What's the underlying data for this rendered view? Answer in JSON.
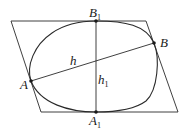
{
  "diagram": {
    "colors": {
      "stroke": "#2a2a2a",
      "background": "#ffffff",
      "text": "#1a1a1a"
    },
    "parallelogram": {
      "vertices": [
        [
          11,
          21
        ],
        [
          146,
          21
        ],
        [
          178,
          112
        ],
        [
          41,
          112
        ]
      ]
    },
    "points": {
      "A": {
        "label": "A",
        "sub": "",
        "x": 31,
        "y": 81
      },
      "B": {
        "label": "B",
        "sub": "",
        "x": 154,
        "y": 43
      },
      "A1": {
        "label": "A",
        "sub": "1",
        "x": 96,
        "y": 112
      },
      "B1": {
        "label": "B",
        "sub": "1",
        "x": 96,
        "y": 21
      }
    },
    "segments": {
      "h": {
        "label": "h",
        "sub": "",
        "from": "A",
        "to": "B"
      },
      "h1": {
        "label": "h",
        "sub": "1",
        "from": "B1",
        "to": "A1"
      }
    }
  }
}
